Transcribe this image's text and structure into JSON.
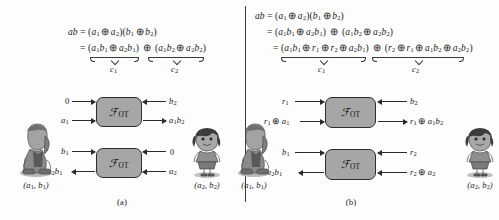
{
  "figure": {
    "divider_color": "#3a3a3a",
    "box_fill": "#a6a6a6",
    "box_stroke": "#2e2e2e"
  },
  "panel_a": {
    "caption": "(a)",
    "equations": [
      "ab = (a1 ⊕ a2)(b1 ⊕ b2)",
      "= (a1b1 ⊕ a2b1) ⊕ (a1b2 ⊕ a2b2)"
    ],
    "brace_labels": {
      "left": "c1",
      "right": "c2"
    },
    "boxes": [
      {
        "label_script": "ℱ",
        "label_sub": "OT"
      },
      {
        "label_script": "ℱ",
        "label_sub": "OT"
      }
    ],
    "box_top": {
      "in_left_upper": "0",
      "in_left_lower": "a1",
      "in_right_upper": "b2",
      "out_right_lower": "a1b2"
    },
    "box_bottom": {
      "in_left_upper": "b1",
      "out_left_lower": "a2b1",
      "in_right_upper": "0",
      "in_right_lower": "a2"
    },
    "party_left_label": "(a1, b1)",
    "party_right_label": "(a2, b2)"
  },
  "panel_b": {
    "caption": "(b)",
    "equations": [
      "ab = (a1 ⊕ a2)(b1 ⊕ b2)",
      "= (a1b1 ⊕ a2b1) ⊕ (a1b2 ⊕ a2b2)",
      "= (a1b1 ⊕ r1 ⊕ r2 ⊕ a2b1) ⊕ (r2 ⊕ r1 ⊕ a1b2 ⊕ a2b2)"
    ],
    "brace_labels": {
      "left": "c1",
      "right": "c2"
    },
    "boxes": [
      {
        "label_script": "ℱ",
        "label_sub": "OT"
      },
      {
        "label_script": "ℱ",
        "label_sub": "OT"
      }
    ],
    "box_top": {
      "in_left_upper": "r1",
      "in_left_lower": "r1 ⊕ a1",
      "in_right_upper": "b2",
      "out_right_lower": "r1 ⊕ a1b2"
    },
    "box_bottom": {
      "in_left_upper": "b1",
      "out_left_lower": "r2 ⊕ a2b1",
      "in_right_upper": "r2",
      "in_right_lower": "r2 ⊕ a2"
    },
    "party_left_label": "(a1, b1)",
    "party_right_label": "(a2, b2)"
  }
}
